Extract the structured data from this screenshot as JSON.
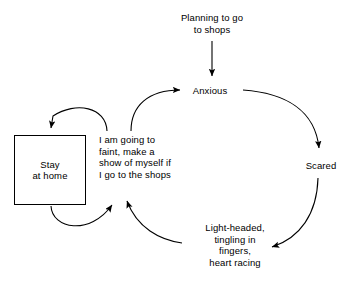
{
  "diagram": {
    "background_color": "#ffffff",
    "line_color": "#000000",
    "text_color": "#000000",
    "nodes": {
      "trigger": {
        "label": "Planning to go\nto shops",
        "role": "trigger"
      },
      "emotion_first": {
        "label": "Anxious",
        "role": "emotion"
      },
      "emotion_second": {
        "label": "Scared",
        "role": "emotion"
      },
      "physical_symptoms": {
        "label": "Light-headed,\ntingling in\nfingers,\nheart racing",
        "role": "physical-sensations"
      },
      "thought": {
        "label": "I am going to\nfaint, make a\nshow of myself if\nI go to the shops",
        "role": "thought"
      },
      "behaviour": {
        "label": "Stay\nat home",
        "role": "behaviour-box"
      }
    },
    "connections": [
      {
        "from": "trigger",
        "to": "emotion_first",
        "style": "straight-down-arrow"
      },
      {
        "from": "emotion_first",
        "to": "emotion_second",
        "style": "curve-right-down-arrow"
      },
      {
        "from": "emotion_second",
        "to": "physical_symptoms",
        "style": "curve-down-left-arrow"
      },
      {
        "from": "physical_symptoms",
        "to": "thought",
        "style": "curve-left-up-arrow"
      },
      {
        "from": "thought",
        "to": "behaviour",
        "style": "curve-left-down-arrow"
      },
      {
        "from": "behaviour",
        "to": "thought",
        "style": "curve-right-up-arrow"
      },
      {
        "from": "thought",
        "to": "emotion_first",
        "style": "curve-up-right-arrow"
      }
    ]
  }
}
